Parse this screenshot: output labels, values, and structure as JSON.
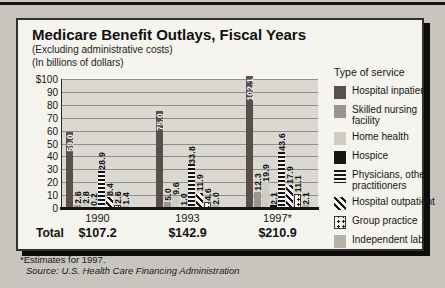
{
  "chart": {
    "title": "Medicare Benefit Outlays, Fiscal Years",
    "subtitle1": "(Excluding administrative costs)",
    "subtitle2": "(In billions of dollars)",
    "total_row_label": "Total"
  },
  "chart_data": {
    "type": "bar",
    "title": "Medicare Benefit Outlays, Fiscal Years",
    "subtitle": "(Excluding administrative costs) (In billions of dollars)",
    "categories": [
      "1990",
      "1993",
      "1997*"
    ],
    "series": [
      {
        "name": "Hospital inpatient",
        "values": [
          59.0,
          75.0,
          102.1
        ],
        "style": "solid-dark",
        "color": "#5a4f4b"
      },
      {
        "name": "Skilled nursing facility",
        "values": [
          2.6,
          5.0,
          12.3
        ],
        "style": "solid-medium",
        "color": "#9b958d"
      },
      {
        "name": "Home health",
        "values": [
          2.8,
          9.6,
          19.9
        ],
        "style": "solid-light",
        "color": "#cfccc3"
      },
      {
        "name": "Hospice",
        "values": [
          0.2,
          1.0,
          2.1
        ],
        "style": "solid-black",
        "color": "#161616"
      },
      {
        "name": "Physicians, other practitioners",
        "values": [
          28.9,
          33.8,
          43.6
        ],
        "style": "stripes-horizontal",
        "color": "#141414"
      },
      {
        "name": "Hospital outpatient",
        "values": [
          8.4,
          11.9,
          17.9
        ],
        "style": "stripes-diagonal",
        "color": "#141414"
      },
      {
        "name": "Group practice",
        "values": [
          2.6,
          4.6,
          11.1
        ],
        "style": "dots",
        "color": "#141414"
      },
      {
        "name": "Independent labs",
        "values": [
          1.4,
          2.0,
          2.1
        ],
        "style": "solid-gray",
        "color": "#b5b1a8"
      }
    ],
    "totals": [
      "$107.2",
      "$142.9",
      "$210.9"
    ],
    "y_ticks": [
      "$100",
      "90",
      "80",
      "70",
      "60",
      "50",
      "40",
      "30",
      "20",
      "10",
      "0"
    ],
    "ylim": [
      0,
      100
    ],
    "grid": true,
    "legend_position": "right"
  },
  "legend": {
    "header": "Type of service"
  },
  "footnotes": {
    "estimate_note": "*Estimates for 1997.",
    "source": "Source: U.S. Health Care Financing Administration"
  }
}
